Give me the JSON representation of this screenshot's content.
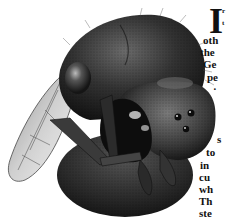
{
  "page": {
    "type": "magazine-page-fragment",
    "illustration": {
      "subject": "insect-head-with-wing",
      "description": "Pen-and-ink stippled illustration of a wasp/bee head, three-quarter view, with compound eye, three ocelli, mandibles, antenna base, and translucent veined wing"
    },
    "article": {
      "drop_cap": "I",
      "lines": [
        {
          "text": "r",
          "x": 222,
          "y": 8
        },
        {
          "text": "t",
          "x": 222,
          "y": 20
        },
        {
          "text": "oth",
          "x": 203,
          "y": 35
        },
        {
          "text": "the",
          "x": 200,
          "y": 47
        },
        {
          "text": "Ge",
          "x": 203,
          "y": 59
        },
        {
          "text": "pe",
          "x": 207,
          "y": 72
        },
        {
          "text": "·",
          "x": 213,
          "y": 85
        },
        {
          "text": "s",
          "x": 217,
          "y": 135
        },
        {
          "text": "to",
          "x": 206,
          "y": 148
        },
        {
          "text": "in",
          "x": 200,
          "y": 161
        },
        {
          "text": "cu",
          "x": 199,
          "y": 173
        },
        {
          "text": "wh",
          "x": 199,
          "y": 185
        },
        {
          "text": "Th",
          "x": 199,
          "y": 197
        },
        {
          "text": "ste",
          "x": 199,
          "y": 209
        }
      ]
    },
    "colors": {
      "background": "#ffffff",
      "ink": "#111111",
      "body_dark": "#1e1e1e",
      "body_mid": "#4a4a4a",
      "highlight": "#d8d8d8"
    }
  }
}
